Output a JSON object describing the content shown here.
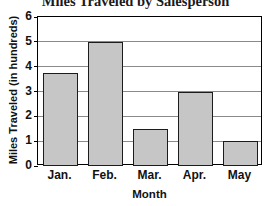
{
  "chart_data": {
    "type": "bar",
    "title": "Miles Traveled by Salesperson",
    "xlabel": "Month",
    "ylabel": "Miles Traveled (in hundreds)",
    "categories": [
      "Jan.",
      "Feb.",
      "Mar.",
      "Apr.",
      "May"
    ],
    "values": [
      3.75,
      5,
      1.5,
      3,
      1
    ],
    "ylim": [
      0,
      6
    ],
    "ytick_labels": [
      "0",
      "1",
      "2",
      "3",
      "4",
      "5",
      "6"
    ],
    "ytick_values": [
      0,
      1,
      2,
      3,
      4,
      5,
      6
    ],
    "grid": true,
    "legend": "none",
    "bar_fill_color": "#c6c6c6",
    "bar_edge_color": "#1c1c1c",
    "gridline_color": "#8a8a8a",
    "axis_color": "#000000"
  }
}
